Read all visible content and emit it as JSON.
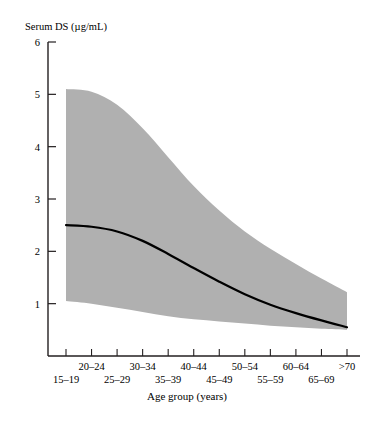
{
  "chart_data": {
    "type": "area",
    "title": "",
    "ylabel": "Serum DS (µg/mL)",
    "xlabel": "Age group (years)",
    "ylim": [
      0,
      6
    ],
    "yticks": [
      1,
      2,
      3,
      4,
      5,
      6
    ],
    "ytick_labels": [
      "1",
      "2",
      "3",
      "4",
      "5",
      "6"
    ],
    "grid": false,
    "legend": "none",
    "categories": [
      "15–19",
      "20–24",
      "25–29",
      "30–34",
      "35–39",
      "40–44",
      "45–49",
      "50–54",
      "55–59",
      "60–64",
      "65–69",
      ">70"
    ],
    "xtick_labels_upper": [
      "",
      "20–24",
      "",
      "30–34",
      "",
      "40–44",
      "",
      "50–54",
      "",
      "60–64",
      "",
      ">70"
    ],
    "xtick_labels_lower": [
      "15–19",
      "",
      "25–29",
      "",
      "35–39",
      "",
      "45–49",
      "",
      "55–59",
      "",
      "65–69",
      ""
    ],
    "series": [
      {
        "name": "mean",
        "style": "line",
        "color": "#000000",
        "values": [
          2.5,
          2.47,
          2.38,
          2.2,
          1.95,
          1.68,
          1.42,
          1.18,
          0.98,
          0.82,
          0.68,
          0.55
        ]
      },
      {
        "name": "upper-bound",
        "style": "band-edge",
        "color": "#b0b0b0",
        "values": [
          5.1,
          5.05,
          4.8,
          4.35,
          3.8,
          3.25,
          2.78,
          2.38,
          2.05,
          1.76,
          1.48,
          1.22
        ]
      },
      {
        "name": "lower-bound",
        "style": "band-edge",
        "color": "#b0b0b0",
        "values": [
          1.05,
          1.0,
          0.92,
          0.84,
          0.76,
          0.7,
          0.66,
          0.62,
          0.58,
          0.55,
          0.52,
          0.5
        ]
      }
    ],
    "band_fill": "#b0b0b0",
    "axis_color": "#231f20"
  },
  "axes": {
    "y_axis_label": "Serum DS (µg/mL)",
    "x_axis_label": "Age group (years)"
  }
}
